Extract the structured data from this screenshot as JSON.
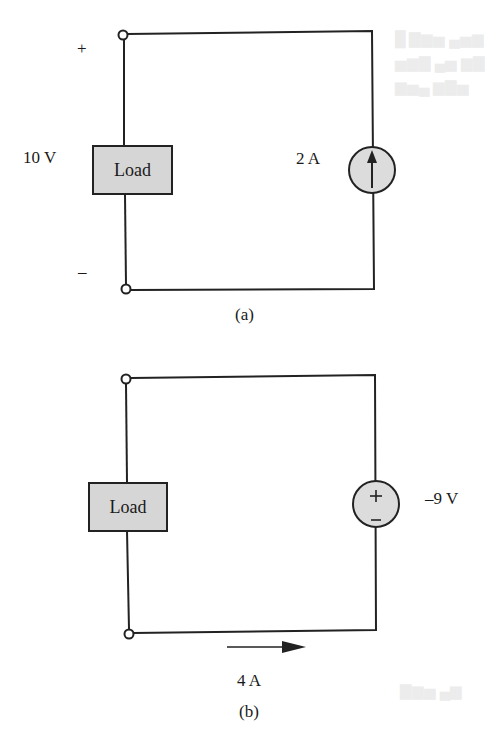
{
  "figure": {
    "circuit_a": {
      "caption": "(a)",
      "load_label": "Load",
      "voltage_label": "10 V",
      "plus_sign": "+",
      "minus_sign": "–",
      "source_type": "current-source",
      "source_label": "2 A",
      "source_direction": "up"
    },
    "circuit_b": {
      "caption": "(b)",
      "load_label": "Load",
      "source_type": "voltage-source",
      "source_label": "–9 V",
      "source_plus": "+",
      "source_minus": "–",
      "current_label": "4 A",
      "current_direction": "right"
    }
  },
  "colors": {
    "wire": "#222222",
    "load_fill": "#d6d6d6",
    "source_fill": "#dcdcdc",
    "background": "#ffffff"
  }
}
